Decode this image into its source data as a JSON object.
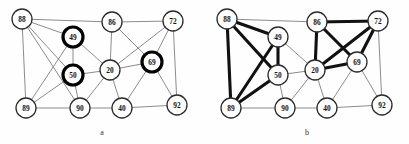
{
  "figure": {
    "width": 409,
    "height": 144,
    "background": "#ffffff"
  },
  "colors": {
    "edge_thin": "#6f6f6f",
    "edge_thick": "#111111",
    "node_stroke": "#2b2b2b",
    "node_highlight_stroke": "#000000",
    "node_fill": "#ffffff",
    "label": "#111111"
  },
  "panels": [
    {
      "id": "a",
      "caption": "a",
      "nodes": [
        {
          "id": "88",
          "label": "88",
          "x": 22,
          "y": 19,
          "r": 10,
          "highlight": false
        },
        {
          "id": "49",
          "label": "49",
          "x": 73,
          "y": 37,
          "r": 10,
          "highlight": true
        },
        {
          "id": "86",
          "label": "86",
          "x": 112,
          "y": 22,
          "r": 10,
          "highlight": false
        },
        {
          "id": "72",
          "label": "72",
          "x": 173,
          "y": 21,
          "r": 10,
          "highlight": false
        },
        {
          "id": "50",
          "label": "50",
          "x": 73,
          "y": 75,
          "r": 10,
          "highlight": true
        },
        {
          "id": "20",
          "label": "20",
          "x": 110,
          "y": 70,
          "r": 10,
          "highlight": false
        },
        {
          "id": "69",
          "label": "69",
          "x": 152,
          "y": 62,
          "r": 10,
          "highlight": true
        },
        {
          "id": "89",
          "label": "89",
          "x": 26,
          "y": 108,
          "r": 10,
          "highlight": false
        },
        {
          "id": "90",
          "label": "90",
          "x": 80,
          "y": 108,
          "r": 10,
          "highlight": false
        },
        {
          "id": "40",
          "label": "40",
          "x": 122,
          "y": 108,
          "r": 10,
          "highlight": false
        },
        {
          "id": "92",
          "label": "92",
          "x": 177,
          "y": 105,
          "r": 10,
          "highlight": false
        }
      ],
      "edges": [
        {
          "from": "88",
          "to": "86",
          "weight": "thin"
        },
        {
          "from": "86",
          "to": "72",
          "weight": "thin"
        },
        {
          "from": "88",
          "to": "49",
          "weight": "thin"
        },
        {
          "from": "88",
          "to": "89",
          "weight": "thin"
        },
        {
          "from": "88",
          "to": "90",
          "weight": "thin"
        },
        {
          "from": "88",
          "to": "50",
          "weight": "thin"
        },
        {
          "from": "49",
          "to": "50",
          "weight": "thin"
        },
        {
          "from": "49",
          "to": "89",
          "weight": "thin"
        },
        {
          "from": "49",
          "to": "20",
          "weight": "thin"
        },
        {
          "from": "50",
          "to": "89",
          "weight": "thin"
        },
        {
          "from": "50",
          "to": "90",
          "weight": "thin"
        },
        {
          "from": "50",
          "to": "20",
          "weight": "thin"
        },
        {
          "from": "86",
          "to": "20",
          "weight": "thin"
        },
        {
          "from": "86",
          "to": "69",
          "weight": "thin"
        },
        {
          "from": "72",
          "to": "20",
          "weight": "thin"
        },
        {
          "from": "72",
          "to": "69",
          "weight": "thin"
        },
        {
          "from": "72",
          "to": "92",
          "weight": "thin"
        },
        {
          "from": "20",
          "to": "69",
          "weight": "thin"
        },
        {
          "from": "20",
          "to": "90",
          "weight": "thin"
        },
        {
          "from": "20",
          "to": "40",
          "weight": "thin"
        },
        {
          "from": "69",
          "to": "40",
          "weight": "thin"
        },
        {
          "from": "69",
          "to": "92",
          "weight": "thin"
        },
        {
          "from": "89",
          "to": "90",
          "weight": "thin"
        },
        {
          "from": "90",
          "to": "40",
          "weight": "thin"
        },
        {
          "from": "40",
          "to": "92",
          "weight": "thin"
        }
      ]
    },
    {
      "id": "b",
      "caption": "b",
      "nodes": [
        {
          "id": "88",
          "label": "88",
          "x": 22,
          "y": 19,
          "r": 10,
          "highlight": false
        },
        {
          "id": "49",
          "label": "49",
          "x": 73,
          "y": 37,
          "r": 10,
          "highlight": false
        },
        {
          "id": "86",
          "label": "86",
          "x": 112,
          "y": 22,
          "r": 10,
          "highlight": false
        },
        {
          "id": "72",
          "label": "72",
          "x": 173,
          "y": 21,
          "r": 10,
          "highlight": false
        },
        {
          "id": "50",
          "label": "50",
          "x": 73,
          "y": 75,
          "r": 10,
          "highlight": false
        },
        {
          "id": "20",
          "label": "20",
          "x": 110,
          "y": 70,
          "r": 10,
          "highlight": false
        },
        {
          "id": "69",
          "label": "69",
          "x": 152,
          "y": 62,
          "r": 10,
          "highlight": false
        },
        {
          "id": "89",
          "label": "89",
          "x": 26,
          "y": 108,
          "r": 10,
          "highlight": false
        },
        {
          "id": "90",
          "label": "90",
          "x": 80,
          "y": 108,
          "r": 10,
          "highlight": false
        },
        {
          "id": "40",
          "label": "40",
          "x": 122,
          "y": 108,
          "r": 10,
          "highlight": false
        },
        {
          "id": "92",
          "label": "92",
          "x": 177,
          "y": 105,
          "r": 10,
          "highlight": false
        }
      ],
      "edges": [
        {
          "from": "88",
          "to": "86",
          "weight": "thin"
        },
        {
          "from": "86",
          "to": "72",
          "weight": "thick"
        },
        {
          "from": "88",
          "to": "49",
          "weight": "thick"
        },
        {
          "from": "88",
          "to": "89",
          "weight": "thick"
        },
        {
          "from": "88",
          "to": "50",
          "weight": "thick"
        },
        {
          "from": "49",
          "to": "50",
          "weight": "thick"
        },
        {
          "from": "49",
          "to": "89",
          "weight": "thick"
        },
        {
          "from": "50",
          "to": "89",
          "weight": "thick"
        },
        {
          "from": "86",
          "to": "20",
          "weight": "thick"
        },
        {
          "from": "86",
          "to": "69",
          "weight": "thick"
        },
        {
          "from": "72",
          "to": "20",
          "weight": "thick"
        },
        {
          "from": "72",
          "to": "69",
          "weight": "thick"
        },
        {
          "from": "20",
          "to": "69",
          "weight": "thick"
        },
        {
          "from": "49",
          "to": "20",
          "weight": "thin"
        },
        {
          "from": "50",
          "to": "20",
          "weight": "thin"
        },
        {
          "from": "50",
          "to": "90",
          "weight": "thin"
        },
        {
          "from": "72",
          "to": "92",
          "weight": "thin"
        },
        {
          "from": "20",
          "to": "90",
          "weight": "thin"
        },
        {
          "from": "20",
          "to": "40",
          "weight": "thin"
        },
        {
          "from": "69",
          "to": "40",
          "weight": "thin"
        },
        {
          "from": "69",
          "to": "92",
          "weight": "thin"
        },
        {
          "from": "89",
          "to": "90",
          "weight": "thin"
        },
        {
          "from": "90",
          "to": "40",
          "weight": "thin"
        },
        {
          "from": "40",
          "to": "92",
          "weight": "thin"
        }
      ]
    }
  ]
}
